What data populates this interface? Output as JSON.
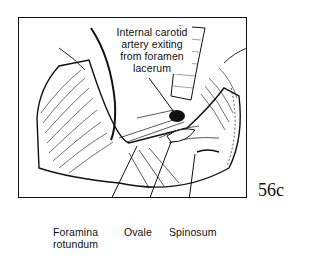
{
  "figure": {
    "id": "56c"
  },
  "labels": {
    "top_callout": {
      "line1": "Internal carotid",
      "line2": "artery exiting",
      "line3": "from foramen",
      "line4": "lacerum"
    },
    "foramina_rotundum": {
      "line1": "Foramina",
      "line2": "rotundum"
    },
    "ovale": "Ovale",
    "spinosum": "Spinosum"
  },
  "colors": {
    "ink": "#111111",
    "background": "#ffffff"
  }
}
